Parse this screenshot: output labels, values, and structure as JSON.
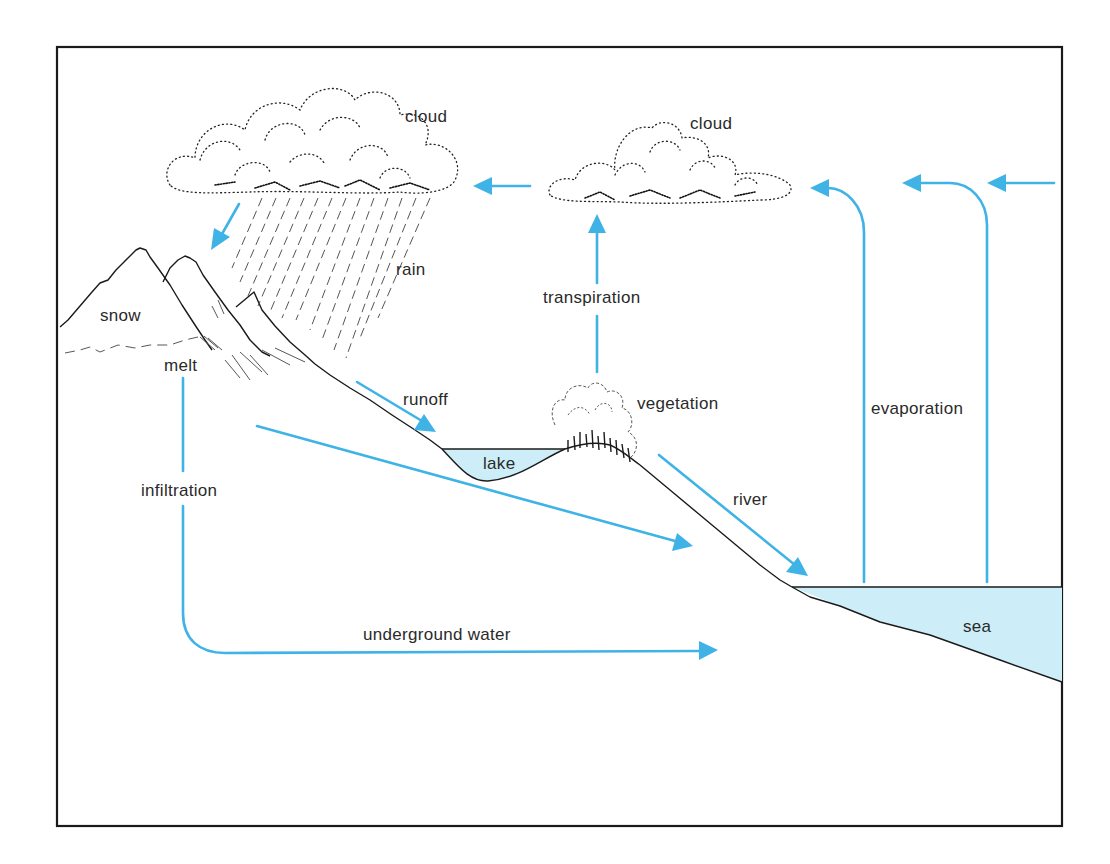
{
  "diagram": {
    "frame": {
      "x": 57,
      "y": 47,
      "width": 1005,
      "height": 779
    },
    "colors": {
      "flow_arrow": "#3fb3e6",
      "water_fill": "#cdeef8",
      "line_ink": "#1a1a1a",
      "background": "#ffffff"
    },
    "labels": {
      "cloud_left": "cloud",
      "cloud_right": "cloud",
      "rain": "rain",
      "snow": "snow",
      "melt": "melt",
      "runoff": "runoff",
      "transpiration": "transpiration",
      "vegetation": "vegetation",
      "lake": "lake",
      "evaporation": "evaporation",
      "infiltration": "infiltration",
      "river": "river",
      "sea": "sea",
      "underground_water": "underground water"
    },
    "flows": [
      {
        "name": "rain-to-mountain",
        "from": "cloud (left)",
        "to": "mountains",
        "direction": "down-left"
      },
      {
        "name": "cloud-drift",
        "from": "cloud (right)",
        "to": "cloud (left)",
        "direction": "left"
      },
      {
        "name": "evaporation-1",
        "from": "sea",
        "to": "cloud (right)",
        "direction": "up then left"
      },
      {
        "name": "evaporation-2",
        "from": "sea",
        "to": "cloud (right)",
        "direction": "up then left"
      },
      {
        "name": "incoming-air",
        "from": "right edge",
        "to": "left",
        "direction": "left"
      },
      {
        "name": "transpiration",
        "from": "vegetation",
        "to": "cloud (right)",
        "direction": "up"
      },
      {
        "name": "runoff",
        "from": "mountain slope",
        "to": "lake",
        "direction": "down-right"
      },
      {
        "name": "subsurface-flow",
        "from": "mountain base",
        "to": "hillside",
        "direction": "down-right"
      },
      {
        "name": "river",
        "from": "vegetation hill",
        "to": "sea",
        "direction": "down-right"
      },
      {
        "name": "infiltration-underground",
        "from": "melt",
        "to": "underground water",
        "direction": "down then right"
      }
    ]
  }
}
